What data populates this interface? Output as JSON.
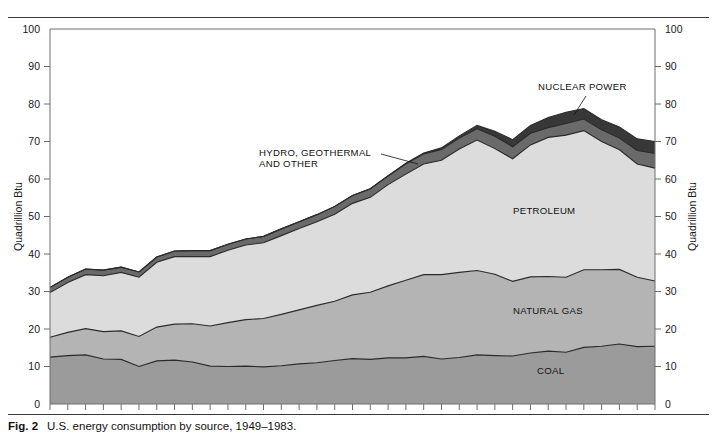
{
  "figure": {
    "number_label": "Fig. 2",
    "caption": "U.S. energy consumption by source, 1949–1983."
  },
  "axes": {
    "y_left_title": "Quadrillion Btu",
    "y_right_title": "Quadrillion Btu",
    "y_ticks": [
      "0",
      "10",
      "20",
      "30",
      "40",
      "50",
      "60",
      "70",
      "80",
      "90",
      "100"
    ],
    "x_ticks": [
      "1949",
      "1955",
      "1960",
      "1965",
      "1970",
      "1975",
      "1980",
      "1983"
    ]
  },
  "annotations": {
    "nuclear": "NUCLEAR POWER",
    "hydro_line1": "HYDRO, GEOTHERMAL",
    "hydro_line2": "AND OTHER",
    "petroleum": "PETROLEUM",
    "natural_gas": "NATURAL GAS",
    "coal": "COAL"
  },
  "colors": {
    "coal": "#9b9b9b",
    "natural_gas": "#b4b4b4",
    "petroleum": "#dcdcdc",
    "hydro": "#6a6a6a",
    "nuclear": "#383838",
    "outline": "#2b2b2b",
    "axis": "#6e6e6e",
    "rule": "#3a3a3a"
  },
  "chart_data": {
    "type": "area",
    "stacked": true,
    "title": "U.S. energy consumption by source, 1949–1983",
    "xlabel": "",
    "ylabel": "Quadrillion Btu",
    "xlim": [
      1949,
      1983
    ],
    "ylim": [
      0,
      100
    ],
    "grid": false,
    "legend_position": "inline-annotations",
    "x": [
      1949,
      1950,
      1951,
      1952,
      1953,
      1954,
      1955,
      1956,
      1957,
      1958,
      1959,
      1960,
      1961,
      1962,
      1963,
      1964,
      1965,
      1966,
      1967,
      1968,
      1969,
      1970,
      1971,
      1972,
      1973,
      1974,
      1975,
      1976,
      1977,
      1978,
      1979,
      1980,
      1981,
      1982,
      1983
    ],
    "series": [
      {
        "name": "COAL",
        "values": [
          12.5,
          12.9,
          13.1,
          12.0,
          11.9,
          10.0,
          11.5,
          11.7,
          11.2,
          10.1,
          10.0,
          10.1,
          9.9,
          10.2,
          10.7,
          11.0,
          11.6,
          12.1,
          11.9,
          12.3,
          12.3,
          12.7,
          12.0,
          12.4,
          13.1,
          12.9,
          12.8,
          13.6,
          14.1,
          13.8,
          15.1,
          15.4,
          16.0,
          15.3,
          15.4
        ]
      },
      {
        "name": "NATURAL GAS",
        "values": [
          5.3,
          6.2,
          7.0,
          7.3,
          7.6,
          8.0,
          9.0,
          9.6,
          10.2,
          10.7,
          11.7,
          12.4,
          12.9,
          13.7,
          14.4,
          15.3,
          15.8,
          17.0,
          17.9,
          19.2,
          20.7,
          21.8,
          22.5,
          22.7,
          22.5,
          21.7,
          19.9,
          20.3,
          19.9,
          20.0,
          20.7,
          20.4,
          19.9,
          18.5,
          17.4
        ]
      },
      {
        "name": "PETROLEUM",
        "values": [
          11.9,
          13.3,
          14.4,
          14.9,
          15.6,
          15.8,
          17.3,
          18.0,
          17.9,
          18.5,
          19.3,
          19.9,
          20.2,
          21.0,
          21.7,
          22.3,
          23.2,
          24.4,
          25.3,
          27.0,
          28.3,
          29.5,
          30.5,
          32.9,
          34.8,
          33.5,
          32.7,
          35.2,
          37.1,
          37.9,
          37.1,
          34.2,
          31.9,
          30.2,
          30.1
        ]
      },
      {
        "name": "HYDRO, GEOTHERMAL AND OTHER",
        "values": [
          1.4,
          1.4,
          1.5,
          1.5,
          1.4,
          1.4,
          1.4,
          1.5,
          1.6,
          1.6,
          1.6,
          1.6,
          1.7,
          1.8,
          1.8,
          1.9,
          2.1,
          2.1,
          2.3,
          2.3,
          2.7,
          2.7,
          2.9,
          2.9,
          3.0,
          3.3,
          3.2,
          3.1,
          2.6,
          3.1,
          3.1,
          3.1,
          3.1,
          3.6,
          3.9
        ]
      },
      {
        "name": "NUCLEAR POWER",
        "values": [
          0.0,
          0.0,
          0.0,
          0.0,
          0.0,
          0.0,
          0.0,
          0.0,
          0.0,
          0.0,
          0.0,
          0.0,
          0.0,
          0.0,
          0.0,
          0.0,
          0.0,
          0.0,
          0.0,
          0.1,
          0.2,
          0.2,
          0.4,
          0.6,
          0.9,
          1.3,
          1.9,
          2.1,
          2.7,
          3.0,
          2.8,
          2.7,
          3.0,
          3.1,
          3.2
        ]
      }
    ]
  }
}
